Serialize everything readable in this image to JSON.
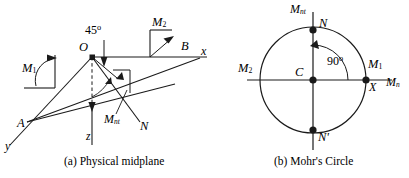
{
  "figure": {
    "panels": [
      {
        "id": "physical-midplane",
        "caption": "(a) Physical midplane",
        "labels": {
          "angle_45": "45",
          "degree_symbol": "o",
          "moment_1": "M",
          "moment_1_sub": "1",
          "moment_2": "M",
          "moment_2_sub": "2",
          "moment_nt": "M",
          "moment_nt_sub": "nt",
          "point_o": "O",
          "point_a": "A",
          "point_b": "B",
          "axis_x": "x",
          "axis_y": "y",
          "axis_z": "z",
          "normal_n": "N"
        }
      },
      {
        "id": "mohrs-circle",
        "caption": "(b) Mohr's Circle",
        "labels": {
          "axis_vertical": "M",
          "axis_vertical_sub": "nt",
          "axis_horizontal": "M",
          "axis_horizontal_sub": "n",
          "point_n": "N",
          "point_n_prime": "N'",
          "point_c": "C",
          "point_x": "X",
          "moment_1": "M",
          "moment_1_sub": "1",
          "moment_2": "M",
          "moment_2_sub": "2",
          "angle_90": "90",
          "degree_symbol": "o"
        }
      }
    ],
    "colors": {
      "stroke": "#1a1a1a",
      "background": "#ffffff"
    }
  }
}
